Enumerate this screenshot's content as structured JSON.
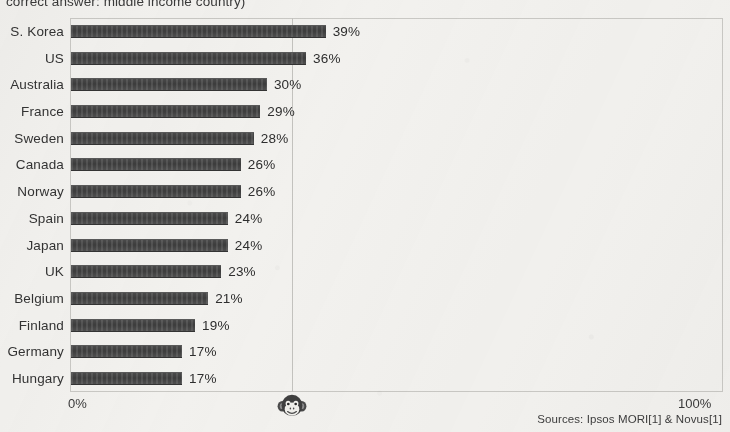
{
  "chart_data": {
    "type": "bar",
    "orientation": "horizontal",
    "title": "correct answer: middle income country)",
    "xlabel": "",
    "ylabel": "",
    "xlim": [
      0,
      100
    ],
    "xtick_labels": [
      "0%",
      "100%"
    ],
    "grid": true,
    "gridlines": [
      34
    ],
    "categories": [
      "S. Korea",
      "US",
      "Australia",
      "France",
      "Sweden",
      "Canada",
      "Norway",
      "Spain",
      "Japan",
      "UK",
      "Belgium",
      "Finland",
      "Germany",
      "Hungary"
    ],
    "values": [
      39,
      36,
      30,
      29,
      28,
      26,
      26,
      24,
      24,
      23,
      21,
      19,
      17,
      17
    ],
    "value_labels": [
      "39%",
      "36%",
      "30%",
      "29%",
      "28%",
      "26%",
      "26%",
      "24%",
      "24%",
      "23%",
      "21%",
      "19%",
      "17%",
      "17%"
    ],
    "annotations": [
      {
        "name": "monkey-chance-marker",
        "icon": "monkey-face-icon",
        "x": 34,
        "description": "monkey random-guess level marker"
      }
    ],
    "source_note": "Sources: Ipsos MORI[1] & Novus[1]",
    "bar_color": "#3f3f3f",
    "background_color": "#f2f1ee",
    "frame_color": "#c9c8c4"
  },
  "axis": {
    "zero_label": "0%",
    "hundred_label": "100%"
  },
  "footer": {
    "sources": "Sources: Ipsos MORI[1] & Novus[1]"
  }
}
